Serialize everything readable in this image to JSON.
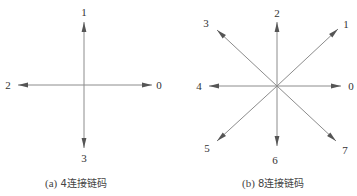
{
  "colors": {
    "line": "#8c8c8c",
    "arrowhead": "#555555",
    "label": "#333333",
    "background": "#ffffff"
  },
  "panels": [
    {
      "id": "a",
      "caption": "(a) 4连接链码",
      "caption_prefix": "(a)",
      "caption_text": "4连接链码",
      "center": [
        84,
        85
      ],
      "directions": [
        {
          "code": "0",
          "tip": [
            152,
            85
          ],
          "label_pos": [
            159,
            89
          ]
        },
        {
          "code": "1",
          "tip": [
            84,
            22
          ],
          "label_pos": [
            84,
            16
          ]
        },
        {
          "code": "2",
          "tip": [
            18,
            85
          ],
          "label_pos": [
            8,
            89
          ]
        },
        {
          "code": "3",
          "tip": [
            84,
            148
          ],
          "label_pos": [
            84,
            162
          ]
        }
      ]
    },
    {
      "id": "b",
      "caption": "(b) 8连接链码",
      "caption_prefix": "(b)",
      "caption_text": "8连接链码",
      "center": [
        277,
        86
      ],
      "directions": [
        {
          "code": "0",
          "tip": [
            341,
            86
          ],
          "label_pos": [
            351,
            90
          ]
        },
        {
          "code": "1",
          "tip": [
            338,
            29
          ],
          "label_pos": [
            346,
            28
          ]
        },
        {
          "code": "2",
          "tip": [
            277,
            22
          ],
          "label_pos": [
            277,
            17
          ]
        },
        {
          "code": "3",
          "tip": [
            217,
            30
          ],
          "label_pos": [
            206,
            27
          ]
        },
        {
          "code": "4",
          "tip": [
            209,
            86
          ],
          "label_pos": [
            199,
            90
          ]
        },
        {
          "code": "5",
          "tip": [
            217,
            141
          ],
          "label_pos": [
            207,
            152
          ]
        },
        {
          "code": "6",
          "tip": [
            277,
            146
          ],
          "label_pos": [
            275,
            164
          ]
        },
        {
          "code": "7",
          "tip": [
            336,
            141
          ],
          "label_pos": [
            345,
            154
          ]
        }
      ]
    }
  ]
}
